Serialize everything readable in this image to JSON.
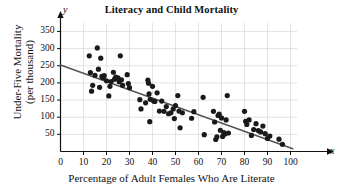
{
  "chart_data": {
    "type": "scatter",
    "title": "Literacy and Child Mortality",
    "xlabel": "Percentage of Adult Females Who Are Literate",
    "ylabel_line1": "Under-Five Mortality",
    "ylabel_line2": "(per thousand)",
    "x_axis_letter": "x",
    "y_axis_letter": "y",
    "xlim": [
      0,
      103
    ],
    "ylim": [
      0,
      375
    ],
    "xticks": [
      0,
      10,
      20,
      30,
      40,
      50,
      60,
      70,
      80,
      90,
      100
    ],
    "yticks": [
      50,
      100,
      150,
      200,
      250,
      300,
      350
    ],
    "grid": true,
    "grid_color": "#d8d8d8",
    "axis_color": "#111111",
    "point_color": "#1a1a1a",
    "point_radius": 2.6,
    "trendline": {
      "label": "least-squares regression line",
      "color": "#555555",
      "x_start": 0,
      "y_start": 252,
      "x_end": 101,
      "y_end": 8
    },
    "points": [
      [
        12.5,
        279
      ],
      [
        13.0,
        230
      ],
      [
        13.5,
        176
      ],
      [
        14.0,
        193
      ],
      [
        15.0,
        222
      ],
      [
        16.0,
        302
      ],
      [
        16.5,
        240
      ],
      [
        17.0,
        187
      ],
      [
        17.5,
        272
      ],
      [
        18.0,
        219
      ],
      [
        18.5,
        215
      ],
      [
        19.0,
        221
      ],
      [
        20.0,
        206
      ],
      [
        21.0,
        162
      ],
      [
        21.5,
        190
      ],
      [
        22.0,
        204
      ],
      [
        23.0,
        231
      ],
      [
        23.5,
        211
      ],
      [
        24.0,
        217
      ],
      [
        25.0,
        215
      ],
      [
        25.5,
        203
      ],
      [
        26.0,
        279
      ],
      [
        26.5,
        209
      ],
      [
        27.0,
        193
      ],
      [
        29.0,
        224
      ],
      [
        29.5,
        198
      ],
      [
        30.0,
        186
      ],
      [
        34.5,
        151
      ],
      [
        35.0,
        124
      ],
      [
        37.0,
        142
      ],
      [
        38.0,
        208
      ],
      [
        38.3,
        199
      ],
      [
        38.5,
        168
      ],
      [
        38.8,
        87
      ],
      [
        39.0,
        152
      ],
      [
        40.0,
        190
      ],
      [
        40.5,
        147
      ],
      [
        41.0,
        146
      ],
      [
        42.0,
        171
      ],
      [
        43.0,
        118
      ],
      [
        44.0,
        147
      ],
      [
        45.0,
        117
      ],
      [
        46.0,
        131
      ],
      [
        47.0,
        110
      ],
      [
        48.0,
        113
      ],
      [
        49.0,
        124
      ],
      [
        49.5,
        96
      ],
      [
        50.0,
        134
      ],
      [
        51.0,
        163
      ],
      [
        51.5,
        118
      ],
      [
        52.0,
        69
      ],
      [
        53.0,
        113
      ],
      [
        57.0,
        97
      ],
      [
        58.0,
        116
      ],
      [
        62.0,
        158
      ],
      [
        62.5,
        49
      ],
      [
        66.5,
        117
      ],
      [
        67.0,
        86
      ],
      [
        67.5,
        35
      ],
      [
        68.0,
        43
      ],
      [
        68.5,
        105
      ],
      [
        69.0,
        109
      ],
      [
        69.5,
        62
      ],
      [
        70.0,
        98
      ],
      [
        70.5,
        44
      ],
      [
        71.0,
        55
      ],
      [
        71.5,
        51
      ],
      [
        72.0,
        92
      ],
      [
        72.5,
        163
      ],
      [
        73.0,
        54
      ],
      [
        80.0,
        117
      ],
      [
        80.5,
        88
      ],
      [
        81.0,
        79
      ],
      [
        82.0,
        92
      ],
      [
        83.0,
        47
      ],
      [
        84.0,
        64
      ],
      [
        85.0,
        81
      ],
      [
        86.0,
        61
      ],
      [
        87.0,
        57
      ],
      [
        88.0,
        74
      ],
      [
        89.0,
        52
      ],
      [
        90.0,
        38
      ],
      [
        91.0,
        45
      ],
      [
        95.0,
        36
      ],
      [
        96.5,
        21
      ]
    ]
  }
}
